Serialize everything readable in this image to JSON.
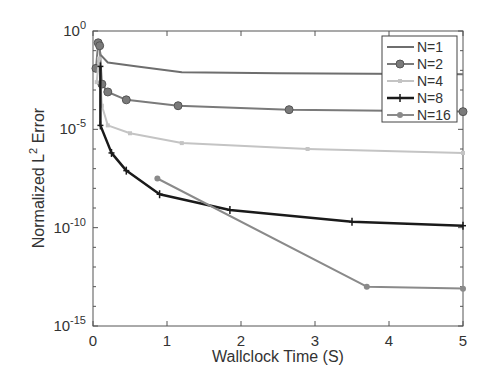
{
  "chart_data": {
    "type": "line",
    "title": "",
    "xlabel": "Wallclock Time (S)",
    "ylabel": "Normalized L^2 Error",
    "ylabel_parts": {
      "pre": "Normalized L",
      "sup": "2",
      "post": " Error"
    },
    "xlim": [
      0,
      5
    ],
    "ylim_log10": [
      -15,
      0
    ],
    "yscale": "log",
    "grid": false,
    "legend_position": "upper right",
    "x_ticks": [
      "0",
      "1",
      "2",
      "3",
      "4",
      "5"
    ],
    "y_ticks": [
      {
        "base": "10",
        "exp": "0",
        "log": 0
      },
      {
        "base": "10",
        "exp": "-5",
        "log": -5
      },
      {
        "base": "10",
        "exp": "-10",
        "log": -10
      },
      {
        "base": "10",
        "exp": "-15",
        "log": -15
      }
    ],
    "series": [
      {
        "name": "N=1",
        "color": "#6e6e6e",
        "width": 2,
        "marker": "none",
        "x": [
          0.08,
          0.1,
          0.2,
          0.6,
          1.2,
          2.5,
          5.0
        ],
        "log_y": [
          -0.6,
          -1.2,
          -1.6,
          -1.8,
          -2.1,
          -2.15,
          -2.2
        ]
      },
      {
        "name": "N=2",
        "color": "#7a7a7a",
        "width": 2,
        "marker": "circle",
        "x": [
          0.04,
          0.07,
          0.09,
          0.12,
          0.2,
          0.45,
          1.15,
          2.65,
          5.0
        ],
        "log_y": [
          -1.9,
          -0.6,
          -0.75,
          -2.7,
          -3.1,
          -3.5,
          -3.8,
          -4.0,
          -4.1
        ]
      },
      {
        "name": "N=4",
        "color": "#c4c4c4",
        "width": 2,
        "marker": "small-square",
        "x": [
          0.05,
          0.08,
          0.12,
          0.2,
          0.5,
          1.2,
          2.9,
          5.0
        ],
        "log_y": [
          -2.6,
          -1.4,
          -3.8,
          -4.8,
          -5.2,
          -5.7,
          -6.0,
          -6.2
        ]
      },
      {
        "name": "N=8",
        "color": "#1a1a1a",
        "width": 2.5,
        "marker": "plus",
        "x": [
          0.1,
          0.1,
          0.25,
          0.45,
          0.9,
          1.85,
          3.5,
          5.0
        ],
        "log_y": [
          -1.8,
          -4.8,
          -6.2,
          -7.1,
          -8.3,
          -9.1,
          -9.7,
          -9.9
        ]
      },
      {
        "name": "N=16",
        "color": "#8a8a8a",
        "width": 2,
        "marker": "dot",
        "x": [
          0.87,
          3.7,
          5.0
        ],
        "log_y": [
          -7.5,
          -13.0,
          -13.1
        ]
      }
    ]
  }
}
